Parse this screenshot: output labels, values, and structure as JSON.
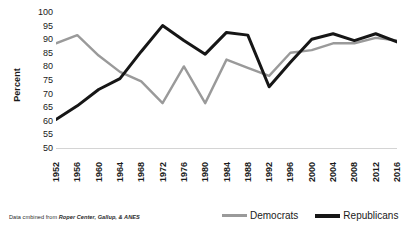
{
  "chart_data": {
    "type": "line",
    "title": "",
    "subtitle": "",
    "xlabel": "",
    "ylabel": "Percent",
    "ylim": [
      50,
      100
    ],
    "ytick_step": 5,
    "yticks": [
      100,
      95,
      90,
      85,
      80,
      75,
      70,
      65,
      60,
      55,
      50
    ],
    "grid": false,
    "legend_position": "bottom-right",
    "x": [
      1952,
      1956,
      1960,
      1964,
      1968,
      1972,
      1976,
      1980,
      1984,
      1988,
      1992,
      1996,
      2000,
      2004,
      2008,
      2012,
      2016
    ],
    "categories": [
      "1952",
      "1956",
      "1960",
      "1964",
      "1968",
      "1972",
      "1976",
      "1980",
      "1984",
      "1988",
      "1992",
      "1996",
      "2000",
      "2004",
      "2008",
      "2012",
      "2016"
    ],
    "series": [
      {
        "name": "Democrats",
        "color": "#9a9a9a",
        "values": [
          88.5,
          91.5,
          84.0,
          78.0,
          74.5,
          66.5,
          80.0,
          66.5,
          82.5,
          79.5,
          76.5,
          85.0,
          86.0,
          88.5,
          88.5,
          90.5,
          89.5
        ]
      },
      {
        "name": "Republicans",
        "color": "#161616",
        "values": [
          60.5,
          65.5,
          71.5,
          75.5,
          85.5,
          95.0,
          89.5,
          84.5,
          92.5,
          91.5,
          72.5,
          81.5,
          90.0,
          92.0,
          89.5,
          92.0,
          89.0
        ]
      }
    ],
    "annotations": {
      "footnote_prefix": "Data cmbined from",
      "footnote_source": "Roper Center, Gallup, & ANES"
    }
  },
  "axis": {
    "y_title": "Percent",
    "y_ticks": [
      "100",
      "95",
      "90",
      "85",
      "80",
      "75",
      "70",
      "65",
      "60",
      "55",
      "50"
    ],
    "x_ticks": [
      "1952",
      "1956",
      "1960",
      "1964",
      "1968",
      "1972",
      "1976",
      "1980",
      "1984",
      "1988",
      "1992",
      "1996",
      "2000",
      "2004",
      "2008",
      "2012",
      "2016"
    ]
  },
  "legend": {
    "items": [
      {
        "label": "Democrats",
        "color": "#9a9a9a"
      },
      {
        "label": "Republicans",
        "color": "#161616"
      }
    ]
  },
  "footnote": {
    "prefix": "Data cmbined from",
    "source": "Roper Center, Gallup, & ANES"
  },
  "colors": {
    "democrats": "#9a9a9a",
    "republicans": "#161616",
    "background": "#ffffff",
    "axis_line": "#d4d4d4",
    "text": "#1a1a1a"
  }
}
